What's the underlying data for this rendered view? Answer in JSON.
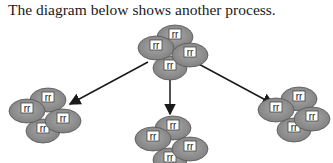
{
  "caption": "The diagram below shows another process.",
  "diagram": {
    "type": "process-diagram",
    "cell_fill": "#8f8f8f",
    "cell_stroke": "#555555",
    "label_box_fill": "#ffffff",
    "arrow_color": "#1a1a1a",
    "parent_cluster": {
      "labels": [
        "rr",
        "rr",
        "rr",
        "rr"
      ]
    },
    "child_clusters": [
      {
        "position": "left",
        "labels": [
          "rr",
          "rr",
          "rr",
          "rr"
        ]
      },
      {
        "position": "center",
        "labels": [
          "rr",
          "rr",
          "rr",
          "rr"
        ]
      },
      {
        "position": "right",
        "labels": [
          "rr",
          "rr",
          "rr",
          "rr"
        ]
      }
    ],
    "arrows": [
      {
        "from": "parent",
        "to": "left"
      },
      {
        "from": "parent",
        "to": "center"
      },
      {
        "from": "parent",
        "to": "right"
      }
    ]
  }
}
